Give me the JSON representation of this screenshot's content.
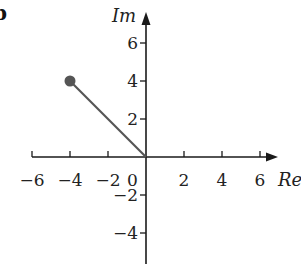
{
  "figure": {
    "label": "b"
  },
  "chart_data": {
    "type": "scatter",
    "title": "",
    "xlabel": "Re",
    "ylabel": "Im",
    "xlim": [
      -6,
      6.8
    ],
    "ylim": [
      -5.3,
      7.2
    ],
    "grid": false,
    "x_ticks": [
      -6,
      -4,
      -2,
      2,
      4,
      6
    ],
    "x_tick_labels": [
      "−6",
      "−4",
      "−2",
      "2",
      "4",
      "6"
    ],
    "y_ticks": [
      6,
      4,
      2,
      -2,
      -4
    ],
    "y_tick_labels": [
      "6",
      "4",
      "2",
      "−2",
      "−4"
    ],
    "origin_label": "0",
    "points": [
      {
        "x": -4,
        "y": 4,
        "label": "",
        "color": "#555555"
      }
    ],
    "segments": [
      {
        "from": [
          0,
          0
        ],
        "to": [
          -4,
          4
        ],
        "color": "#555555"
      }
    ],
    "legend": null
  },
  "colors": {
    "axis": "#1a1a1a",
    "vector": "#555555",
    "point": "#555555",
    "text": "#222222"
  }
}
